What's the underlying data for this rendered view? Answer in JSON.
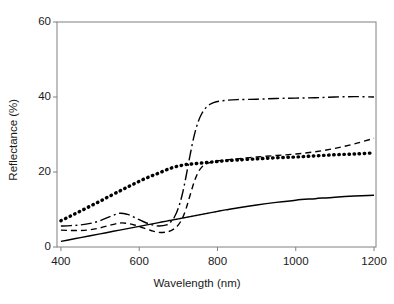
{
  "chart_data": {
    "type": "line",
    "title": "",
    "xlabel": "Wavelength (nm)",
    "ylabel": "Reflectance (%)",
    "xlim": [
      390,
      1205
    ],
    "ylim": [
      0,
      60
    ],
    "xticks": [
      400,
      600,
      800,
      1000,
      1200
    ],
    "yticks": [
      0,
      20,
      40,
      60
    ],
    "grid": false,
    "legend": "none",
    "frame": "box",
    "x": [
      400,
      425,
      450,
      475,
      500,
      525,
      550,
      570,
      590,
      610,
      630,
      650,
      670,
      680,
      690,
      700,
      710,
      720,
      730,
      740,
      750,
      760,
      770,
      780,
      790,
      800,
      820,
      850,
      900,
      950,
      1000,
      1050,
      1100,
      1150,
      1200
    ],
    "series": [
      {
        "name": "dotted-curve",
        "style": "dotted",
        "values": [
          7.0,
          8.3,
          9.6,
          10.9,
          12.2,
          13.6,
          14.9,
          16.0,
          17.0,
          18.0,
          18.9,
          19.7,
          20.6,
          21.0,
          21.3,
          21.6,
          21.8,
          22.0,
          22.1,
          22.2,
          22.3,
          22.4,
          22.5,
          22.6,
          22.7,
          22.8,
          23.0,
          23.2,
          23.5,
          23.8,
          24.0,
          24.3,
          24.6,
          24.8,
          25.1
        ]
      },
      {
        "name": "dash-dot-curve",
        "style": "dash-dot",
        "values": [
          5.6,
          5.7,
          5.9,
          6.3,
          7.0,
          8.1,
          9.0,
          8.7,
          7.8,
          6.8,
          6.0,
          5.6,
          5.9,
          6.6,
          8.0,
          10.4,
          14.0,
          19.0,
          24.5,
          29.5,
          33.2,
          35.6,
          37.1,
          38.0,
          38.5,
          38.8,
          39.1,
          39.3,
          39.4,
          39.6,
          39.7,
          39.8,
          40.0,
          40.1,
          40.0
        ]
      },
      {
        "name": "dashed-curve",
        "style": "dashed",
        "values": [
          4.5,
          4.4,
          4.4,
          4.6,
          5.1,
          5.8,
          6.4,
          6.3,
          5.8,
          5.1,
          4.4,
          3.9,
          4.0,
          4.3,
          4.9,
          5.9,
          7.6,
          10.3,
          13.8,
          17.2,
          19.8,
          21.3,
          22.1,
          22.5,
          22.8,
          23.0,
          23.2,
          23.5,
          24.0,
          24.4,
          24.8,
          25.4,
          26.3,
          27.5,
          29.0
        ]
      },
      {
        "name": "solid-curve",
        "style": "solid",
        "values": [
          1.5,
          2.0,
          2.5,
          3.0,
          3.5,
          4.0,
          4.5,
          4.9,
          5.3,
          5.7,
          6.1,
          6.5,
          6.9,
          7.1,
          7.3,
          7.5,
          7.7,
          7.9,
          8.1,
          8.3,
          8.5,
          8.7,
          8.9,
          9.1,
          9.3,
          9.5,
          9.9,
          10.4,
          11.2,
          11.9,
          12.5,
          12.9,
          13.3,
          13.6,
          13.8
        ]
      }
    ]
  },
  "axes": {
    "xtick_labels": [
      "400",
      "600",
      "800",
      "1000",
      "1200"
    ],
    "ytick_labels": [
      "0",
      "20",
      "40",
      "60"
    ],
    "xlabel": "Wavelength (nm)",
    "ylabel": "Reflectance (%)"
  },
  "colors": {
    "line": "#000000",
    "frame": "#808080",
    "background": "#ffffff",
    "text": "#1a1a1a"
  }
}
